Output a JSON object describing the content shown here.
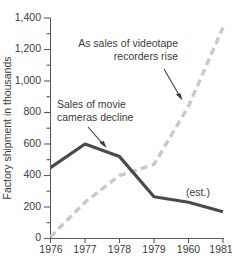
{
  "chart_data": {
    "type": "line",
    "title": "",
    "xlabel": "",
    "ylabel": "Factory shipment in thousands",
    "x": [
      "1976",
      "1977",
      "1978",
      "1979",
      "1960",
      "1981"
    ],
    "xlim": [
      1976,
      1981
    ],
    "ylim": [
      0,
      1400
    ],
    "ytick_labels": [
      "0",
      "200",
      "400",
      "600",
      "800",
      "1,000",
      "1,200",
      "1,400"
    ],
    "ytick_values": [
      0,
      200,
      400,
      600,
      800,
      1000,
      1200,
      1400
    ],
    "yminor_step": 100,
    "grid": false,
    "legend": "none",
    "series": [
      {
        "name": "Sales of movie cameras",
        "style": "solid",
        "color": "#4a4a4a",
        "values": [
          450,
          600,
          520,
          265,
          230,
          170
        ]
      },
      {
        "name": "Sales of videotape recorders",
        "style": "dashed",
        "color": "#c9c9c9",
        "values": [
          10,
          230,
          400,
          470,
          840,
          1340
        ]
      }
    ],
    "annotations": [
      {
        "name": "videotape-annotation",
        "line1": "As sales of videotape",
        "line2": "recorders rise",
        "align": "right"
      },
      {
        "name": "movie-camera-annotation",
        "line1": "Sales of movie",
        "line2": "cameras decline",
        "align": "left"
      },
      {
        "name": "estimate-note",
        "line1": "(est.)",
        "line2": "",
        "align": "left"
      }
    ]
  }
}
